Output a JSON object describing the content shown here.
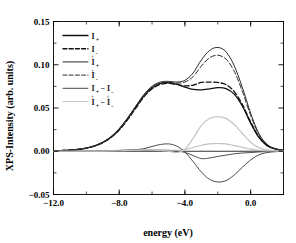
{
  "chart_data": {
    "type": "line",
    "title": "",
    "xlabel": "energy (eV)",
    "ylabel": "XPS-Intensity (arb. units)",
    "xlim": [
      -12.0,
      2.0
    ],
    "ylim": [
      -0.05,
      0.15
    ],
    "xticks": [
      "-12.0",
      "-8.0",
      "-4.0",
      "0.0"
    ],
    "xtick_values": [
      -12.0,
      -8.0,
      -4.0,
      0.0
    ],
    "yticks": [
      "-0.05",
      "0.00",
      "0.05",
      "0.10",
      "0.15"
    ],
    "ytick_values": [
      -0.05,
      0.0,
      0.05,
      0.1,
      0.15
    ],
    "grid": false,
    "legend_position": "upper-left",
    "zero_line": true,
    "x": [
      -12.0,
      -11.5,
      -11.0,
      -10.5,
      -10.0,
      -9.5,
      -9.0,
      -8.5,
      -8.0,
      -7.5,
      -7.0,
      -6.5,
      -6.0,
      -5.5,
      -5.0,
      -4.5,
      -4.0,
      -3.5,
      -3.0,
      -2.5,
      -2.0,
      -1.5,
      -1.0,
      -0.5,
      0.0,
      0.5,
      1.0,
      1.5,
      2.0
    ],
    "series": [
      {
        "name": "I_plus_down",
        "label_base": "I",
        "label_sup": "",
        "label_sub": "+",
        "style": "solid",
        "color": "#111111",
        "width": 1.3,
        "values": [
          0.0005,
          0.0008,
          0.0013,
          0.0022,
          0.0037,
          0.0062,
          0.0102,
          0.0165,
          0.0255,
          0.0375,
          0.051,
          0.064,
          0.0735,
          0.0785,
          0.0795,
          0.0775,
          0.0742,
          0.0715,
          0.071,
          0.0722,
          0.0735,
          0.0725,
          0.066,
          0.052,
          0.0325,
          0.016,
          0.0065,
          0.0025,
          0.001
        ]
      },
      {
        "name": "I_minus_down",
        "label_base": "I",
        "label_sup": "",
        "label_sub": "-",
        "style": "dashed",
        "color": "#111111",
        "width": 1.3,
        "values": [
          0.0005,
          0.0008,
          0.0013,
          0.0022,
          0.0036,
          0.006,
          0.0098,
          0.0158,
          0.0245,
          0.0362,
          0.0495,
          0.0628,
          0.0722,
          0.0772,
          0.0785,
          0.0772,
          0.0755,
          0.0765,
          0.0795,
          0.08,
          0.0795,
          0.077,
          0.069,
          0.054,
          0.034,
          0.0168,
          0.0068,
          0.0026,
          0.001
        ]
      },
      {
        "name": "I_up_plus",
        "label_base": "I",
        "label_sup": "↑",
        "label_sub": "+",
        "style": "solid",
        "color": "#2b2b2b",
        "width": 1.0,
        "values": [
          0.0005,
          0.0008,
          0.0013,
          0.0022,
          0.0037,
          0.0063,
          0.0104,
          0.0168,
          0.026,
          0.0382,
          0.052,
          0.0655,
          0.0752,
          0.08,
          0.0808,
          0.08,
          0.082,
          0.0905,
          0.1055,
          0.1165,
          0.12,
          0.115,
          0.099,
          0.0735,
          0.044,
          0.0205,
          0.008,
          0.003,
          0.0012
        ]
      },
      {
        "name": "I_up_minus",
        "label_base": "I",
        "label_sup": "↑",
        "label_sub": "-",
        "style": "dashed",
        "color": "#2b2b2b",
        "width": 1.0,
        "values": [
          0.0005,
          0.0008,
          0.0013,
          0.0022,
          0.0036,
          0.0061,
          0.01,
          0.0162,
          0.025,
          0.0368,
          0.0505,
          0.0638,
          0.0735,
          0.0785,
          0.0795,
          0.0788,
          0.08,
          0.0862,
          0.0985,
          0.108,
          0.111,
          0.1065,
          0.0925,
          0.069,
          0.0415,
          0.0195,
          0.0076,
          0.0029,
          0.0011
        ]
      },
      {
        "name": "I_plus_minus_diff_down",
        "label_base": "I",
        "label_sup": "",
        "label_sub": "+",
        "label_base2": "I",
        "label_sup2": "",
        "label_sub2": "-",
        "style": "solid",
        "color": "#3a3a3a",
        "width": 0.9,
        "values": [
          0.0,
          0.0,
          0.0,
          0.0,
          0.0001,
          0.0002,
          0.0004,
          0.0007,
          0.001,
          0.0013,
          0.0015,
          0.0012,
          0.0013,
          0.0013,
          0.001,
          0.0003,
          -0.0013,
          -0.005,
          -0.0085,
          -0.0078,
          -0.006,
          -0.0045,
          -0.003,
          -0.002,
          -0.0015,
          -0.0008,
          -0.0003,
          -0.0001,
          0.0
        ]
      },
      {
        "name": "I_up_plus_minus_diff",
        "label_base": "I",
        "label_sup": "↑",
        "label_sub": "+",
        "label_base2": "I",
        "label_sup2": "↑",
        "label_sub2": "-",
        "style": "solid",
        "color": "#bfbfbf",
        "width": 1.1,
        "values": [
          0.0,
          0.0,
          0.0,
          0.0,
          0.0001,
          0.0002,
          0.0004,
          0.0006,
          0.001,
          0.0014,
          0.0015,
          0.0017,
          0.0017,
          0.0015,
          0.0013,
          0.0012,
          0.002,
          0.0043,
          0.007,
          0.0085,
          0.009,
          0.0085,
          0.0065,
          0.0045,
          0.0025,
          0.001,
          0.0004,
          0.0001,
          0.0
        ]
      },
      {
        "name": "diff_dark_large",
        "label_base": "",
        "style": "solid",
        "color": "#4a4a4a",
        "width": 1.0,
        "values": [
          0.0,
          0.0,
          0.0,
          0.0001,
          0.0001,
          0.0002,
          0.0003,
          0.0005,
          0.0008,
          0.0012,
          0.0018,
          0.003,
          0.0055,
          0.0078,
          0.0085,
          0.006,
          -0.001,
          -0.012,
          -0.024,
          -0.0325,
          -0.0355,
          -0.034,
          -0.0275,
          -0.0185,
          -0.01,
          -0.0042,
          -0.0015,
          -0.0005,
          -0.0001
        ],
        "hidden_from_legend": true
      },
      {
        "name": "diff_gray_large",
        "label_base": "",
        "style": "solid",
        "color": "#c4c4c4",
        "width": 1.2,
        "values": [
          0.0,
          0.0,
          0.0,
          0.0,
          0.0001,
          0.0001,
          0.0002,
          0.0004,
          0.0006,
          0.0009,
          0.0012,
          0.0015,
          0.0015,
          0.001,
          0.0,
          -0.0015,
          0.002,
          0.015,
          0.03,
          0.0378,
          0.04,
          0.038,
          0.031,
          0.0205,
          0.0105,
          0.0042,
          0.0015,
          0.0004,
          0.0001
        ],
        "hidden_from_legend": true
      }
    ],
    "legend_entries": [
      {
        "sup": "",
        "sub": "+",
        "style": "solid",
        "color": "#111111",
        "width": 1.4,
        "second": null
      },
      {
        "sup": "",
        "sub": "-",
        "style": "dashed",
        "color": "#111111",
        "width": 1.4,
        "second": null
      },
      {
        "sup": "↑",
        "sub": "+",
        "style": "solid",
        "color": "#2b2b2b",
        "width": 1.0,
        "second": null
      },
      {
        "sup": "↑",
        "sub": "-",
        "style": "dashed",
        "color": "#2b2b2b",
        "width": 1.0,
        "second": null
      },
      {
        "sup": "",
        "sub": "+",
        "style": "solid",
        "color": "#4a4a4a",
        "width": 1.0,
        "second": {
          "sup": "",
          "sub": "-"
        }
      },
      {
        "sup": "↑",
        "sub": "+",
        "style": "solid",
        "color": "#c4c4c4",
        "width": 1.2,
        "second": {
          "sup": "↑",
          "sub": "-"
        }
      }
    ],
    "legend_symbol": "I",
    "legend_minus": "−"
  }
}
